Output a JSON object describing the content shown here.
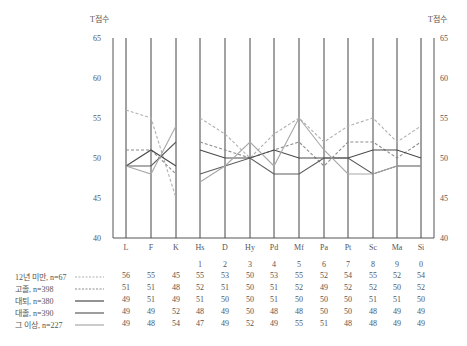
{
  "chart_data": {
    "type": "line",
    "title": "",
    "ylabel_left": "T점수",
    "ylabel_right": "T점수",
    "ylim": [
      40,
      65
    ],
    "yticks": [
      40,
      45,
      50,
      55,
      60,
      65
    ],
    "categories": [
      "L",
      "F",
      "K",
      "Hs",
      "D",
      "Hy",
      "Pd",
      "Mf",
      "Pa",
      "Pt",
      "Sc",
      "Ma",
      "Si"
    ],
    "scale_numbers": [
      "",
      "",
      "",
      "1",
      "2",
      "3",
      "4",
      "5",
      "6",
      "7",
      "8",
      "9",
      "0"
    ],
    "segments_break_after": "K",
    "grid": "vertical lines at each category",
    "legend_position": "bottom-left, inline with data table",
    "series": [
      {
        "name": "12년 미만, n=67",
        "style": "dashed",
        "color": "#b0b0b0",
        "values": [
          56,
          55,
          45,
          55,
          53,
          50,
          53,
          55,
          52,
          54,
          55,
          52,
          54
        ]
      },
      {
        "name": "고졸, n=398",
        "style": "dashed",
        "color": "#8c8c8c",
        "values": [
          51,
          51,
          48,
          52,
          51,
          50,
          51,
          52,
          49,
          52,
          52,
          50,
          52
        ]
      },
      {
        "name": "대퇴, n=380",
        "style": "solid",
        "color": "#4a4a4a",
        "values": [
          49,
          51,
          49,
          51,
          50,
          50,
          51,
          50,
          50,
          50,
          51,
          51,
          50
        ]
      },
      {
        "name": "대졸, n=390",
        "style": "solid",
        "color": "#5c5c5c",
        "values": [
          49,
          49,
          52,
          48,
          49,
          50,
          48,
          48,
          50,
          50,
          48,
          49,
          49
        ]
      },
      {
        "name": "그 이상, n=227",
        "style": "solid",
        "color": "#a8a8a8",
        "values": [
          49,
          48,
          54,
          47,
          49,
          52,
          49,
          55,
          51,
          48,
          48,
          49,
          49
        ]
      }
    ]
  }
}
